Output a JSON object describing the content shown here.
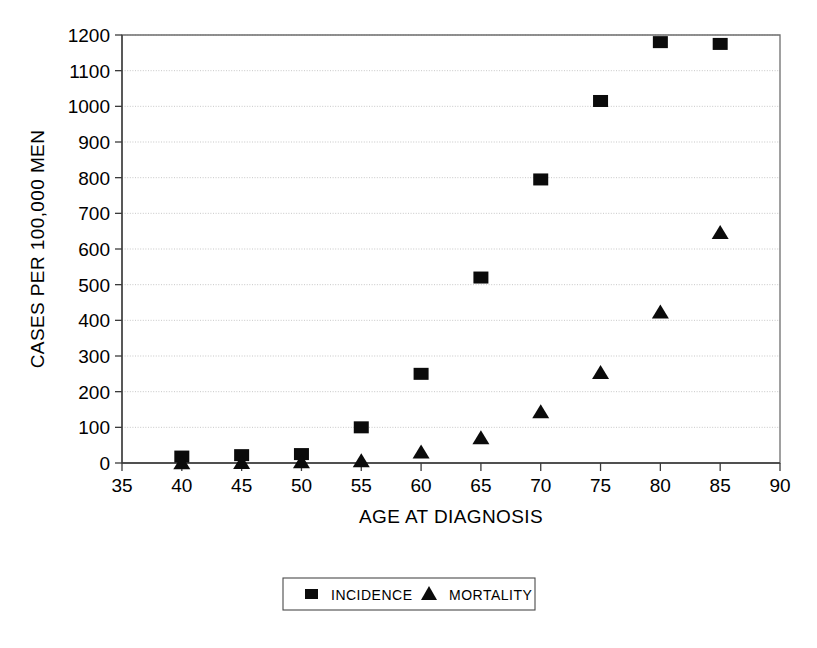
{
  "chart_data": {
    "type": "scatter",
    "title": "",
    "xlabel": "AGE AT DIAGNOSIS",
    "ylabel": "CASES PER 100,000 MEN",
    "xlim": [
      35,
      90
    ],
    "ylim": [
      0,
      1200
    ],
    "xticks": [
      35,
      40,
      45,
      50,
      55,
      60,
      65,
      70,
      75,
      80,
      85,
      90
    ],
    "yticks": [
      0,
      100,
      200,
      300,
      400,
      500,
      600,
      700,
      800,
      900,
      1000,
      1100,
      1200
    ],
    "xtick_labels": [
      "35",
      "40",
      "45",
      "50",
      "55",
      "60",
      "65",
      "70",
      "75",
      "80",
      "85",
      "90"
    ],
    "ytick_labels": [
      "0",
      "100",
      "200",
      "300",
      "400",
      "500",
      "600",
      "700",
      "800",
      "900",
      "1000",
      "1100",
      "1200"
    ],
    "grid": "horizontal",
    "legend_position": "bottom-center",
    "x": [
      40,
      45,
      50,
      55,
      60,
      65,
      70,
      75,
      80,
      85
    ],
    "series": [
      {
        "name": "INCIDENCE",
        "marker": "square",
        "color": "#0b0b0b",
        "values": [
          18,
          22,
          25,
          100,
          250,
          520,
          795,
          1015,
          1180,
          1175
        ]
      },
      {
        "name": "MORTALITY",
        "marker": "triangle",
        "color": "#0b0b0b",
        "values": [
          2,
          3,
          5,
          8,
          32,
          72,
          145,
          255,
          425,
          648
        ]
      }
    ]
  },
  "legend": {
    "entries": [
      {
        "label": "INCIDENCE",
        "marker": "square"
      },
      {
        "label": "MORTALITY",
        "marker": "triangle"
      }
    ]
  },
  "axes": {
    "x_title": "AGE AT DIAGNOSIS",
    "y_title": "CASES PER 100,000 MEN"
  }
}
